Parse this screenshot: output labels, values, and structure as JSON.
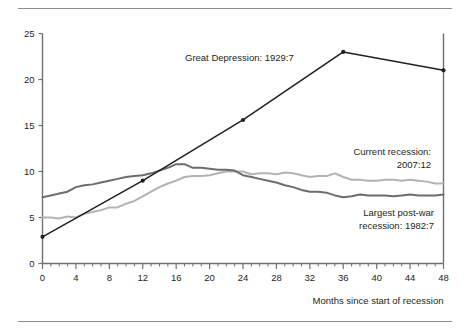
{
  "figure": {
    "top_rule": "rule",
    "bottom_rule": "rule"
  },
  "chart_data": {
    "type": "line",
    "title": "",
    "subtitle": "",
    "xlabel": "Months since start of recession",
    "ylabel": "",
    "xlim": [
      0,
      48
    ],
    "ylim": [
      0,
      25
    ],
    "x_ticks_major": [
      0,
      4,
      8,
      12,
      16,
      20,
      24,
      28,
      32,
      36,
      40,
      44,
      48
    ],
    "x_tick_labels": [
      "0",
      "4",
      "8",
      "12",
      "16",
      "20",
      "24",
      "28",
      "32",
      "36",
      "40",
      "44",
      "48"
    ],
    "x_minor_tick_step": 1,
    "y_ticks": [
      0,
      5,
      10,
      15,
      20,
      25
    ],
    "y_tick_labels": [
      "0",
      "5",
      "10",
      "15",
      "20",
      "25"
    ],
    "grid": false,
    "legend": "inline-annotations",
    "series": [
      {
        "name": "Great Depression: 1929:7",
        "color": "#231f20",
        "style": "solid-with-markers",
        "marker": "filled-circle",
        "x": [
          0,
          12,
          24,
          36,
          48
        ],
        "values": [
          2.9,
          9.0,
          15.6,
          23.0,
          21.0
        ]
      },
      {
        "name": "Largest post-war recession: 1982:7",
        "color": "#6d6d6d",
        "style": "solid",
        "marker": "none",
        "x": [
          0,
          1,
          2,
          3,
          4,
          5,
          6,
          7,
          8,
          9,
          10,
          11,
          12,
          13,
          14,
          15,
          16,
          17,
          18,
          19,
          20,
          21,
          22,
          23,
          24,
          25,
          26,
          27,
          28,
          29,
          30,
          31,
          32,
          33,
          34,
          35,
          36,
          37,
          38,
          39,
          40,
          41,
          42,
          43,
          44,
          45,
          46,
          47,
          48
        ],
        "values": [
          7.2,
          7.4,
          7.6,
          7.8,
          8.3,
          8.5,
          8.6,
          8.8,
          9.0,
          9.2,
          9.4,
          9.5,
          9.6,
          9.8,
          10.1,
          10.4,
          10.8,
          10.8,
          10.4,
          10.4,
          10.3,
          10.2,
          10.2,
          10.1,
          9.6,
          9.4,
          9.2,
          9.0,
          8.8,
          8.5,
          8.3,
          8.0,
          7.8,
          7.8,
          7.7,
          7.4,
          7.2,
          7.3,
          7.5,
          7.4,
          7.4,
          7.4,
          7.3,
          7.4,
          7.5,
          7.4,
          7.4,
          7.4,
          7.5
        ]
      },
      {
        "name": "Current recession: 2007:12",
        "color": "#b3b3b3",
        "style": "solid",
        "marker": "none",
        "x": [
          0,
          1,
          2,
          3,
          4,
          5,
          6,
          7,
          8,
          9,
          10,
          11,
          12,
          13,
          14,
          15,
          16,
          17,
          18,
          19,
          20,
          21,
          22,
          23,
          24,
          25,
          26,
          27,
          28,
          29,
          30,
          31,
          32,
          33,
          34,
          35,
          36,
          37,
          38,
          39,
          40,
          41,
          42,
          43,
          44,
          45,
          46,
          47,
          48
        ],
        "values": [
          5.0,
          5.0,
          4.9,
          5.1,
          5.0,
          5.4,
          5.6,
          5.8,
          6.1,
          6.1,
          6.5,
          6.8,
          7.3,
          7.8,
          8.3,
          8.7,
          9.0,
          9.4,
          9.5,
          9.5,
          9.6,
          9.8,
          10.0,
          10.0,
          10.0,
          9.7,
          9.8,
          9.8,
          9.7,
          9.9,
          9.8,
          9.6,
          9.4,
          9.5,
          9.5,
          9.8,
          9.4,
          9.1,
          9.1,
          9.0,
          9.0,
          9.1,
          9.1,
          9.0,
          9.1,
          9.0,
          8.9,
          8.7,
          8.7
        ]
      }
    ],
    "annotations": [
      {
        "id": "great-depression",
        "lines": [
          "Great Depression: 1929:7"
        ],
        "x_px": 185,
        "y_px": 61,
        "anchor": "start"
      },
      {
        "id": "current-recession",
        "lines": [
          "Current recession:",
          "2007:12"
        ],
        "x_px": 431,
        "y_px": 155,
        "anchor": "end"
      },
      {
        "id": "post-war-recession",
        "lines": [
          "Largest post-war",
          "recession: 1982:7"
        ],
        "x_px": 434,
        "y_px": 216,
        "anchor": "end"
      }
    ]
  }
}
